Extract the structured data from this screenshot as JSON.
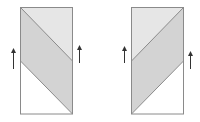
{
  "diagram": {
    "panels": [
      {
        "name": "left-panel",
        "orientation": "descending",
        "arrows": [
          "up",
          "up"
        ]
      },
      {
        "name": "right-panel",
        "orientation": "ascending",
        "arrows": [
          "up",
          "up"
        ]
      }
    ],
    "colors": {
      "border": "#8a8a8a",
      "light_region": "#e6e6e6",
      "band": "#d3d3d3",
      "white_region": "#ffffff",
      "arrow": "#333333"
    }
  }
}
